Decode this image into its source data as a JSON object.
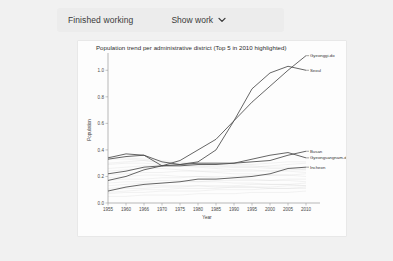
{
  "header": {
    "finished_label": "Finished working",
    "show_work_label": "Show work",
    "chevron_icon": "chevron-down-icon"
  },
  "chart_data": {
    "type": "line",
    "title": "Population trend per administrative district (Top 5 in 2010 highlighted)",
    "xlabel": "Year",
    "ylabel": "Population",
    "xlim": [
      1955,
      2010
    ],
    "ylim": [
      0.0,
      1.1
    ],
    "xticks": [
      1955,
      1960,
      1966,
      1970,
      1975,
      1980,
      1985,
      1990,
      1995,
      2000,
      2005,
      2010
    ],
    "yticks": [
      "0.0",
      "0.2",
      "0.4",
      "0.6",
      "0.8",
      "1.0"
    ],
    "grid": false,
    "legend": "inline-right-labels",
    "x": [
      1955,
      1960,
      1966,
      1970,
      1975,
      1980,
      1985,
      1990,
      1995,
      2000,
      2005,
      2010
    ],
    "series": [
      {
        "name": "Gyeonggi-do",
        "highlighted": true,
        "label_year": 2010,
        "values": [
          0.17,
          0.2,
          0.25,
          0.28,
          0.32,
          0.4,
          0.48,
          0.62,
          0.76,
          0.88,
          1.0,
          1.11
        ]
      },
      {
        "name": "Seoul",
        "highlighted": true,
        "label_year": 2010,
        "values": [
          0.34,
          0.37,
          0.36,
          0.31,
          0.29,
          0.31,
          0.4,
          0.62,
          0.86,
          0.98,
          1.03,
          1.0
        ]
      },
      {
        "name": "Busan",
        "highlighted": true,
        "label_year": 2010,
        "values": [
          0.22,
          0.24,
          0.27,
          0.28,
          0.29,
          0.3,
          0.3,
          0.3,
          0.31,
          0.32,
          0.36,
          0.39
        ]
      },
      {
        "name": "Gyeongsangnam-do",
        "highlighted": true,
        "label_year": 2010,
        "values": [
          0.33,
          0.35,
          0.36,
          0.28,
          0.28,
          0.29,
          0.29,
          0.3,
          0.33,
          0.36,
          0.38,
          0.34
        ]
      },
      {
        "name": "Incheon",
        "highlighted": true,
        "label_year": 2010,
        "values": [
          0.09,
          0.12,
          0.14,
          0.15,
          0.16,
          0.18,
          0.18,
          0.19,
          0.2,
          0.22,
          0.26,
          0.27
        ]
      }
    ],
    "background_series_note": "Faint gray lines: remaining administrative districts, not highlighted",
    "background_series": [
      {
        "values": [
          0.3,
          0.31,
          0.32,
          0.31,
          0.3,
          0.3,
          0.3,
          0.29,
          0.29,
          0.3,
          0.31,
          0.31
        ]
      },
      {
        "values": [
          0.26,
          0.27,
          0.28,
          0.28,
          0.28,
          0.28,
          0.27,
          0.27,
          0.27,
          0.28,
          0.29,
          0.3
        ]
      },
      {
        "values": [
          0.21,
          0.22,
          0.23,
          0.23,
          0.24,
          0.24,
          0.24,
          0.24,
          0.24,
          0.24,
          0.25,
          0.25
        ]
      },
      {
        "values": [
          0.17,
          0.18,
          0.18,
          0.19,
          0.19,
          0.2,
          0.2,
          0.2,
          0.21,
          0.21,
          0.21,
          0.22
        ]
      },
      {
        "values": [
          0.13,
          0.14,
          0.15,
          0.15,
          0.16,
          0.16,
          0.17,
          0.17,
          0.17,
          0.17,
          0.18,
          0.18
        ]
      },
      {
        "values": [
          0.1,
          0.11,
          0.11,
          0.12,
          0.12,
          0.13,
          0.13,
          0.13,
          0.14,
          0.14,
          0.14,
          0.15
        ]
      },
      {
        "values": [
          0.07,
          0.08,
          0.08,
          0.09,
          0.09,
          0.09,
          0.1,
          0.1,
          0.1,
          0.11,
          0.11,
          0.12
        ]
      },
      {
        "values": [
          0.05,
          0.05,
          0.06,
          0.06,
          0.06,
          0.07,
          0.07,
          0.07,
          0.08,
          0.08,
          0.08,
          0.09
        ]
      },
      {
        "values": [
          0.35,
          0.34,
          0.33,
          0.32,
          0.31,
          0.3,
          0.29,
          0.28,
          0.28,
          0.27,
          0.27,
          0.26
        ]
      },
      {
        "values": [
          0.29,
          0.3,
          0.3,
          0.29,
          0.28,
          0.27,
          0.26,
          0.25,
          0.25,
          0.24,
          0.24,
          0.23
        ]
      },
      {
        "values": [
          0.24,
          0.25,
          0.26,
          0.26,
          0.25,
          0.24,
          0.23,
          0.22,
          0.22,
          0.21,
          0.21,
          0.2
        ]
      },
      {
        "values": [
          0.19,
          0.2,
          0.21,
          0.21,
          0.2,
          0.2,
          0.19,
          0.18,
          0.18,
          0.17,
          0.17,
          0.16
        ]
      },
      {
        "values": [
          0.15,
          0.16,
          0.16,
          0.17,
          0.17,
          0.16,
          0.16,
          0.15,
          0.15,
          0.14,
          0.14,
          0.13
        ]
      },
      {
        "values": [
          0.11,
          0.12,
          0.13,
          0.13,
          0.13,
          0.13,
          0.12,
          0.12,
          0.12,
          0.11,
          0.11,
          0.11
        ]
      },
      {
        "values": [
          0.33,
          0.33,
          0.32,
          0.3,
          0.29,
          0.28,
          0.28,
          0.27,
          0.27,
          0.26,
          0.26,
          0.25
        ]
      },
      {
        "values": [
          0.08,
          0.09,
          0.1,
          0.1,
          0.11,
          0.11,
          0.11,
          0.12,
          0.12,
          0.12,
          0.13,
          0.13
        ]
      }
    ]
  }
}
